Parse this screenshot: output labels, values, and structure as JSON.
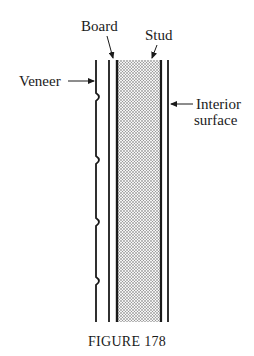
{
  "figure": {
    "caption": "FIGURE 178",
    "labels": {
      "board": "Board",
      "stud": "Stud",
      "veneer": "Veneer",
      "interior_line1": "Interior",
      "interior_line2": "surface"
    }
  },
  "colors": {
    "ink": "#1a1a1a",
    "stipple": "#555555",
    "background": "#ffffff"
  }
}
